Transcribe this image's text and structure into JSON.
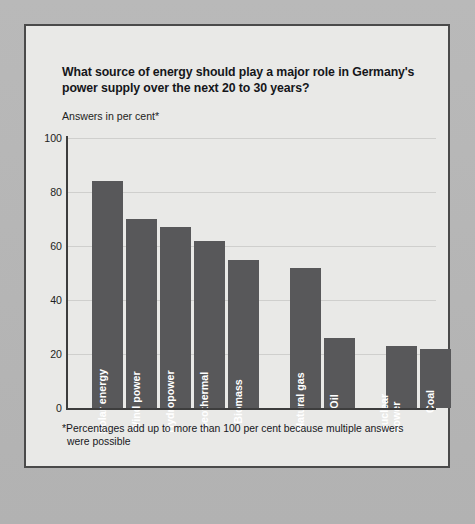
{
  "chart": {
    "title": "What source of energy should play a major role in Germany's power supply over the next 20 to 30 years?",
    "unit_label": "Answers in per cent*",
    "footnote_line1": "*Percentages add up to more than 100 per cent because multiple answers",
    "footnote_line2": "were possible",
    "bar_color": "#58585a",
    "axis_color": "#3d3d3d",
    "grid_color": "#cfcfcd",
    "panel_background": "#e9e9e7",
    "page_background": "#b5b5b5"
  },
  "chart_data": {
    "type": "bar",
    "title": "What source of energy should play a major role in Germany's power supply over the next 20 to 30 years?",
    "subtitle": "Answers in per cent*",
    "xlabel": "",
    "ylabel": "",
    "ylim": [
      0,
      100
    ],
    "yticks": [
      0,
      20,
      40,
      60,
      80,
      100
    ],
    "ytick_labels": [
      "0",
      "20",
      "40",
      "60",
      "80",
      "100"
    ],
    "grid": true,
    "legend": false,
    "orientation": "vertical",
    "categories": [
      "Solar energy",
      "Wind power",
      "Hydropower",
      "Geothermal",
      "Biomass",
      "Natural gas",
      "Oil",
      "Nuclear power",
      "Coal"
    ],
    "values": [
      84,
      70,
      67,
      62,
      55,
      52,
      26,
      23,
      22
    ],
    "groups": [
      {
        "name": "renewables",
        "categories": [
          "Solar energy",
          "Wind power",
          "Hydropower",
          "Geothermal",
          "Biomass"
        ]
      },
      {
        "name": "fossil",
        "categories": [
          "Natural gas",
          "Oil"
        ]
      },
      {
        "name": "nuclear-coal",
        "categories": [
          "Nuclear power",
          "Coal"
        ]
      }
    ],
    "annotation": "*Percentages add up to more than 100 per cent because multiple answers were possible"
  },
  "bars": [
    {
      "label": "Solar energy",
      "value": 84,
      "x": 24,
      "w": 31,
      "lines": 1
    },
    {
      "label": "Wind power",
      "value": 70,
      "x": 58,
      "w": 31,
      "lines": 1
    },
    {
      "label": "Hydropower",
      "value": 67,
      "x": 92,
      "w": 31,
      "lines": 1
    },
    {
      "label": "Geothermal",
      "value": 62,
      "x": 126,
      "w": 31,
      "lines": 1
    },
    {
      "label": "Biomass",
      "value": 55,
      "x": 160,
      "w": 31,
      "lines": 1
    },
    {
      "label": "Natural gas",
      "value": 52,
      "x": 222,
      "w": 31,
      "lines": 1
    },
    {
      "label": "Oil",
      "value": 26,
      "x": 256,
      "w": 31,
      "lines": 1
    },
    {
      "label": "Nuclear power",
      "value": 23,
      "x": 318,
      "w": 31,
      "lines": 2
    },
    {
      "label": "Coal",
      "value": 22,
      "x": 352,
      "w": 31,
      "lines": 1
    }
  ]
}
